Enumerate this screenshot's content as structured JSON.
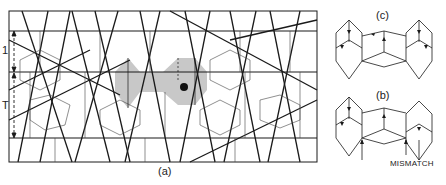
{
  "figure": {
    "panels": [
      {
        "id": "a",
        "label": "(a)",
        "description": "Quasiperiodic tiling pattern with shaded decagon cluster and dot"
      },
      {
        "id": "c",
        "label": "(c)",
        "description": "Two hexagonal tiles joined by central rectangle with arrow decorations"
      },
      {
        "id": "b",
        "label": "(b)",
        "description": "Same tile arrangement showing arrow mismatch"
      }
    ],
    "panel_a": {
      "label": "(a)",
      "dimension_labels": [
        "1",
        "T"
      ]
    },
    "panel_b": {
      "label": "(b)",
      "annotation": "MISMATCH"
    },
    "panel_c": {
      "label": "(c)"
    },
    "colors": {
      "line": "#1a1a1a",
      "shade": "#c8c8c8",
      "background": "#ffffff"
    }
  }
}
